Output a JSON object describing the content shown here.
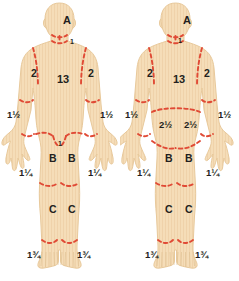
{
  "chart_data": {
    "type": "diagram",
    "subtitle": "Anterior and posterior body diagrams with percent total body surface area",
    "views": [
      {
        "name": "anterior",
        "label": "Anterior view",
        "regions": [
          {
            "id": "head",
            "label": "A",
            "value": "A",
            "x": 63,
            "y": 15,
            "size": "lg"
          },
          {
            "id": "neck",
            "label": "1",
            "value": "1",
            "x": 70,
            "y": 38,
            "size": "xs"
          },
          {
            "id": "shoulder-left",
            "label": "2",
            "value": "2",
            "x": 31,
            "y": 68,
            "size": "md"
          },
          {
            "id": "shoulder-right",
            "label": "2",
            "value": "2",
            "x": 88,
            "y": 68,
            "size": "md"
          },
          {
            "id": "trunk",
            "label": "13",
            "value": "13",
            "x": 57,
            "y": 74,
            "size": "lg"
          },
          {
            "id": "forearm-left",
            "label": "1½",
            "value": "1.5",
            "x": 7,
            "y": 110,
            "size": "sm"
          },
          {
            "id": "forearm-right",
            "label": "1½",
            "value": "1.5",
            "x": 100,
            "y": 110,
            "size": "sm"
          },
          {
            "id": "genitalia",
            "label": "1",
            "value": "1",
            "x": 58,
            "y": 140,
            "size": "xs"
          },
          {
            "id": "thigh-left",
            "label": "B",
            "value": "B",
            "x": 49,
            "y": 153,
            "size": "md"
          },
          {
            "id": "thigh-right",
            "label": "B",
            "value": "B",
            "x": 68,
            "y": 153,
            "size": "md"
          },
          {
            "id": "hand-left",
            "label": "1¼",
            "value": "1.25",
            "x": 19,
            "y": 168,
            "size": "sm"
          },
          {
            "id": "hand-right",
            "label": "1¼",
            "value": "1.25",
            "x": 88,
            "y": 168,
            "size": "sm"
          },
          {
            "id": "leg-left",
            "label": "C",
            "value": "C",
            "x": 49,
            "y": 204,
            "size": "md"
          },
          {
            "id": "leg-right",
            "label": "C",
            "value": "C",
            "x": 68,
            "y": 204,
            "size": "md"
          },
          {
            "id": "foot-left",
            "label": "1¾",
            "value": "1.75",
            "x": 27,
            "y": 250,
            "size": "sm"
          },
          {
            "id": "foot-right",
            "label": "1¾",
            "value": "1.75",
            "x": 77,
            "y": 250,
            "size": "sm"
          }
        ]
      },
      {
        "name": "posterior",
        "label": "Posterior view",
        "regions": [
          {
            "id": "head",
            "label": "A",
            "value": "A",
            "x": 63,
            "y": 15,
            "size": "lg"
          },
          {
            "id": "neck",
            "label": "1",
            "value": "1",
            "x": 58,
            "y": 37,
            "size": "xs"
          },
          {
            "id": "shoulder-left",
            "label": "2",
            "value": "2",
            "x": 27,
            "y": 68,
            "size": "md"
          },
          {
            "id": "shoulder-right",
            "label": "2",
            "value": "2",
            "x": 84,
            "y": 68,
            "size": "md"
          },
          {
            "id": "trunk",
            "label": "13",
            "value": "13",
            "x": 53,
            "y": 74,
            "size": "lg"
          },
          {
            "id": "forearm-left",
            "label": "1½",
            "value": "1.5",
            "x": 5,
            "y": 110,
            "size": "sm"
          },
          {
            "id": "forearm-right",
            "label": "1½",
            "value": "1.5",
            "x": 98,
            "y": 110,
            "size": "sm"
          },
          {
            "id": "buttock-left",
            "label": "2½",
            "value": "2.5",
            "x": 39,
            "y": 120,
            "size": "sm"
          },
          {
            "id": "buttock-right",
            "label": "2½",
            "value": "2.5",
            "x": 64,
            "y": 120,
            "size": "sm"
          },
          {
            "id": "thigh-left",
            "label": "B",
            "value": "B",
            "x": 45,
            "y": 153,
            "size": "md"
          },
          {
            "id": "thigh-right",
            "label": "B",
            "value": "B",
            "x": 65,
            "y": 153,
            "size": "md"
          },
          {
            "id": "hand-left",
            "label": "1¼",
            "value": "1.25",
            "x": 17,
            "y": 168,
            "size": "sm"
          },
          {
            "id": "hand-right",
            "label": "1¼",
            "value": "1.25",
            "x": 86,
            "y": 168,
            "size": "sm"
          },
          {
            "id": "leg-left",
            "label": "C",
            "value": "C",
            "x": 45,
            "y": 204,
            "size": "md"
          },
          {
            "id": "leg-right",
            "label": "C",
            "value": "C",
            "x": 65,
            "y": 204,
            "size": "md"
          },
          {
            "id": "foot-left",
            "label": "1¾",
            "value": "1.75",
            "x": 25,
            "y": 250,
            "size": "sm"
          },
          {
            "id": "foot-right",
            "label": "1¾",
            "value": "1.75",
            "x": 75,
            "y": 250,
            "size": "sm"
          }
        ]
      }
    ]
  },
  "colors": {
    "skin_fill": "#f5ddb8",
    "skin_edge": "#e8c99b",
    "skin_stripe": "#efd0a8",
    "dashed_line": "#e04a35",
    "text": "#231f20",
    "background": "#ffffff"
  }
}
